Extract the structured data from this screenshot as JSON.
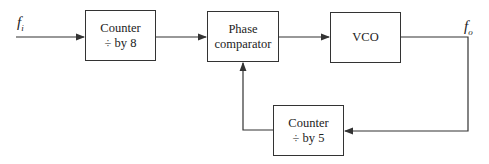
{
  "diagram": {
    "input_label": {
      "main": "f",
      "sub": "i"
    },
    "output_label": {
      "main": "f",
      "sub": "o"
    },
    "blocks": [
      {
        "id": "counter8",
        "line1": "Counter",
        "line2": "÷ by 8"
      },
      {
        "id": "phase",
        "line1": "Phase",
        "line2": "comparator"
      },
      {
        "id": "vco",
        "line1": "VCO",
        "line2": ""
      },
      {
        "id": "counter5",
        "line1": "Counter",
        "line2": "÷ by 5"
      }
    ],
    "line_color": "#333333"
  }
}
